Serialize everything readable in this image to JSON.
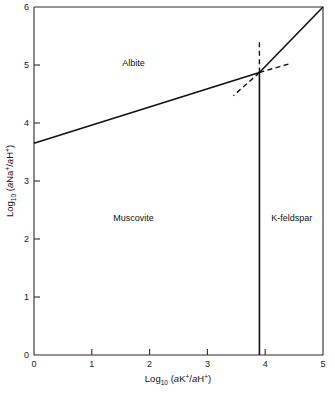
{
  "chart_data": {
    "type": "line",
    "title": "",
    "xlabel": "Log10 (aK+/aH+)",
    "ylabel": "Log10 (aNa+/aH+)",
    "xlabel_parts": {
      "base": "Log",
      "subscript": "10",
      "body_open": " (",
      "ital1": "a",
      "ion1": "K",
      "sup1": "+",
      "slash": "/",
      "ital2": "a",
      "ion2": "H",
      "sup2": "+",
      "body_close": ")"
    },
    "ylabel_parts": {
      "base": "Log",
      "subscript": "10",
      "body_open": " (",
      "ital1": "a",
      "ion1": "Na",
      "sup1": "+",
      "slash": "/",
      "ital2": "a",
      "ion2": "H",
      "sup2": "+",
      "body_close": ")"
    },
    "xlim": [
      0,
      5
    ],
    "ylim": [
      0,
      6
    ],
    "xticks": [
      0,
      1,
      2,
      3,
      4,
      5
    ],
    "yticks": [
      0,
      1,
      2,
      3,
      4,
      5,
      6
    ],
    "xtick_labels": [
      "0",
      "1",
      "2",
      "3",
      "4",
      "5"
    ],
    "ytick_labels": [
      "0",
      "1",
      "2",
      "3",
      "4",
      "5",
      "6"
    ],
    "grid": false,
    "legend": "none",
    "invariant_point": {
      "x": 3.9,
      "y": 4.87
    },
    "series": [
      {
        "name": "albite-muscovite-boundary",
        "style": "solid",
        "points": [
          [
            0,
            3.65
          ],
          [
            3.9,
            4.87
          ]
        ]
      },
      {
        "name": "albite-kfeldspar-boundary",
        "style": "solid",
        "points": [
          [
            3.9,
            4.87
          ],
          [
            5.0,
            6.0
          ]
        ]
      },
      {
        "name": "muscovite-kfeldspar-boundary",
        "style": "solid",
        "points": [
          [
            3.9,
            0.0
          ],
          [
            3.9,
            4.87
          ]
        ]
      },
      {
        "name": "metastable-vertical-extension",
        "style": "dashed",
        "points": [
          [
            3.9,
            4.87
          ],
          [
            3.9,
            5.43
          ]
        ]
      },
      {
        "name": "metastable-lower-left-extension",
        "style": "dashed",
        "points": [
          [
            3.9,
            4.87
          ],
          [
            3.45,
            4.47
          ]
        ]
      },
      {
        "name": "metastable-upper-right-extension",
        "style": "dashed",
        "points": [
          [
            3.9,
            4.87
          ],
          [
            4.45,
            5.03
          ]
        ]
      }
    ],
    "annotations": [
      {
        "name": "albite-field-label",
        "text": "Albite",
        "x": 1.72,
        "y": 5.04
      },
      {
        "name": "muscovite-field-label",
        "text": "Muscovite",
        "x": 1.72,
        "y": 2.36
      },
      {
        "name": "kfeldspar-field-label",
        "text": "K-feldspar",
        "x": 4.46,
        "y": 2.36
      }
    ]
  }
}
